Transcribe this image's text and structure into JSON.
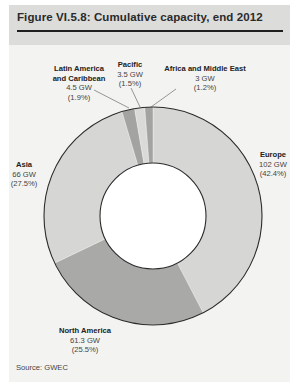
{
  "figure": {
    "title": "Figure VI.5.8: Cumulative capacity, end 2012",
    "source": "Source: GWEC"
  },
  "labels": {
    "europe": {
      "name": "Europe",
      "value": "102 GW",
      "pct": "(42.4%)"
    },
    "north_america": {
      "name": "North America",
      "value": "61.3 GW",
      "pct": "(25.5%)"
    },
    "asia": {
      "name": "Asia",
      "value": "66 GW",
      "pct": "(27.5%)"
    },
    "latin_america": {
      "name1": "Latin America",
      "name2": "and Caribbean",
      "value": "4.5 GW",
      "pct": "(1.9%)"
    },
    "pacific": {
      "name": "Pacific",
      "value": "3.5 GW",
      "pct": "(1.5%)"
    },
    "africa": {
      "name": "Africa and Middle East",
      "value": "3 GW",
      "pct": "(1.2%)"
    }
  },
  "colors": {
    "europe": "#d6d6d4",
    "north_america": "#a9a9a7",
    "asia": "#d6d6d4",
    "latin_america": "#a3a3a1",
    "pacific": "#dadad8",
    "africa": "#a3a3a1",
    "outline": "#2a2a2a"
  },
  "chart_data": {
    "type": "pie",
    "subtype": "donut",
    "title": "Figure VI.5.8: Cumulative capacity, end 2012",
    "unit": "GW",
    "categories": [
      "Europe",
      "North America",
      "Asia",
      "Latin America and Caribbean",
      "Pacific",
      "Africa and Middle East"
    ],
    "values": [
      102,
      61.3,
      66,
      4.5,
      3.5,
      3
    ],
    "percentages": [
      42.4,
      25.5,
      27.5,
      1.9,
      1.5,
      1.2
    ],
    "start_angle": "12 o'clock, clockwise",
    "legend": "none (direct labels)",
    "source": "GWEC"
  }
}
